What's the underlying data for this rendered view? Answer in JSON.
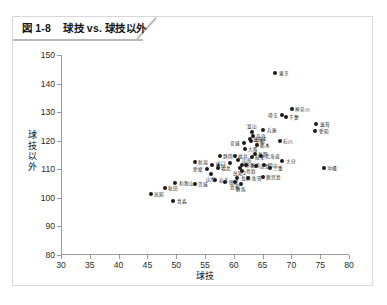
{
  "figure": {
    "number": "図 1-8",
    "title": "球技 vs. 球技以外",
    "title_full": "図 1-8　球技 vs. 球技以外"
  },
  "chart_data": {
    "type": "scatter",
    "title": "球技 vs. 球技以外",
    "xlabel": "球技",
    "ylabel": "球技以外",
    "xlim": [
      30,
      80
    ],
    "ylim": [
      80,
      150
    ],
    "xticks": [
      30,
      35,
      40,
      45,
      50,
      55,
      60,
      65,
      70,
      75,
      80
    ],
    "yticks": [
      80,
      90,
      100,
      110,
      120,
      130,
      140,
      150
    ],
    "grid": false,
    "legend": null,
    "point_color": "#1b1b1b",
    "points": [
      {
        "label": "東京",
        "x": 67.2,
        "y": 143.8,
        "pos": "right"
      },
      {
        "label": "神奈川",
        "x": 70.1,
        "y": 131.2,
        "pos": "right"
      },
      {
        "label": "埼玉",
        "x": 68.3,
        "y": 129.1,
        "pos": "left"
      },
      {
        "label": "千葉",
        "x": 69.0,
        "y": 128.3,
        "pos": "right"
      },
      {
        "label": "滋賀",
        "x": 74.3,
        "y": 126.0,
        "pos": "right"
      },
      {
        "label": "愛知",
        "x": 74.1,
        "y": 123.3,
        "pos": "right"
      },
      {
        "label": "兵庫",
        "x": 65.1,
        "y": 123.6,
        "pos": "right"
      },
      {
        "label": "富山",
        "x": 63.1,
        "y": 123.1,
        "pos": "above"
      },
      {
        "label": "奈良",
        "x": 63.3,
        "y": 121.5,
        "pos": "right"
      },
      {
        "label": "滋賀2",
        "x": 62.8,
        "y": 120.6,
        "pos": "right"
      },
      {
        "label": "京都",
        "x": 63.0,
        "y": 120.0,
        "pos": "right"
      },
      {
        "label": "石川",
        "x": 68.0,
        "y": 119.8,
        "pos": "right"
      },
      {
        "label": "宮城",
        "x": 61.7,
        "y": 119.3,
        "pos": "left"
      },
      {
        "label": "栃木",
        "x": 64.0,
        "y": 118.6,
        "pos": "right"
      },
      {
        "label": "大阪",
        "x": 61.9,
        "y": 117.2,
        "pos": "right"
      },
      {
        "label": "長野",
        "x": 63.6,
        "y": 115.4,
        "pos": "right"
      },
      {
        "label": "北海道",
        "x": 64.8,
        "y": 114.6,
        "pos": "right"
      },
      {
        "label": "静岡",
        "x": 57.6,
        "y": 114.6,
        "pos": "right"
      },
      {
        "label": "福井",
        "x": 60.2,
        "y": 114.8,
        "pos": "right"
      },
      {
        "label": "岐阜",
        "x": 63.1,
        "y": 114.2,
        "pos": "right"
      },
      {
        "label": "山形",
        "x": 60.8,
        "y": 113.1,
        "pos": "right"
      },
      {
        "label": "大分",
        "x": 68.4,
        "y": 112.9,
        "pos": "right"
      },
      {
        "label": "新潟",
        "x": 53.2,
        "y": 112.5,
        "pos": "right"
      },
      {
        "label": "山口",
        "x": 59.3,
        "y": 112.1,
        "pos": "left"
      },
      {
        "label": "熊本",
        "x": 61.4,
        "y": 111.5,
        "pos": "right"
      },
      {
        "label": "宮崎",
        "x": 62.2,
        "y": 111.5,
        "pos": "right"
      },
      {
        "label": "岡山",
        "x": 65.3,
        "y": 111.6,
        "pos": "right"
      },
      {
        "label": "香川",
        "x": 56.3,
        "y": 111.5,
        "pos": "right"
      },
      {
        "label": "広島",
        "x": 63.9,
        "y": 111.1,
        "pos": "right"
      },
      {
        "label": "三重",
        "x": 66.2,
        "y": 110.6,
        "pos": "right"
      },
      {
        "label": "愛媛",
        "x": 55.3,
        "y": 110.1,
        "pos": "left"
      },
      {
        "label": "福島",
        "x": 57.2,
        "y": 110.3,
        "pos": "right"
      },
      {
        "label": "高知2",
        "x": 61.0,
        "y": 110.4,
        "pos": "below"
      },
      {
        "label": "鳥取",
        "x": 61.5,
        "y": 109.4,
        "pos": "right"
      },
      {
        "label": "山梨",
        "x": 56.1,
        "y": 108.2,
        "pos": "below"
      },
      {
        "label": "沖縄",
        "x": 75.6,
        "y": 110.5,
        "pos": "right"
      },
      {
        "label": "鹿児島",
        "x": 65.0,
        "y": 107.2,
        "pos": "right"
      },
      {
        "label": "長崎",
        "x": 60.6,
        "y": 106.9,
        "pos": "right"
      },
      {
        "label": "佐賀",
        "x": 62.5,
        "y": 106.8,
        "pos": "right"
      },
      {
        "label": "岩手",
        "x": 56.8,
        "y": 106.2,
        "pos": "right"
      },
      {
        "label": "徳島",
        "x": 58.5,
        "y": 105.6,
        "pos": "right"
      },
      {
        "label": "島根",
        "x": 60.2,
        "y": 105.4,
        "pos": "below"
      },
      {
        "label": "群馬",
        "x": 61.2,
        "y": 105.0,
        "pos": "below"
      },
      {
        "label": "和歌山",
        "x": 49.8,
        "y": 105.2,
        "pos": "right"
      },
      {
        "label": "茨城",
        "x": 53.2,
        "y": 104.8,
        "pos": "right"
      },
      {
        "label": "秋田",
        "x": 48.0,
        "y": 103.4,
        "pos": "right"
      },
      {
        "label": "高知",
        "x": 45.6,
        "y": 101.3,
        "pos": "right"
      },
      {
        "label": "青森",
        "x": 49.5,
        "y": 98.9,
        "pos": "right"
      }
    ]
  }
}
